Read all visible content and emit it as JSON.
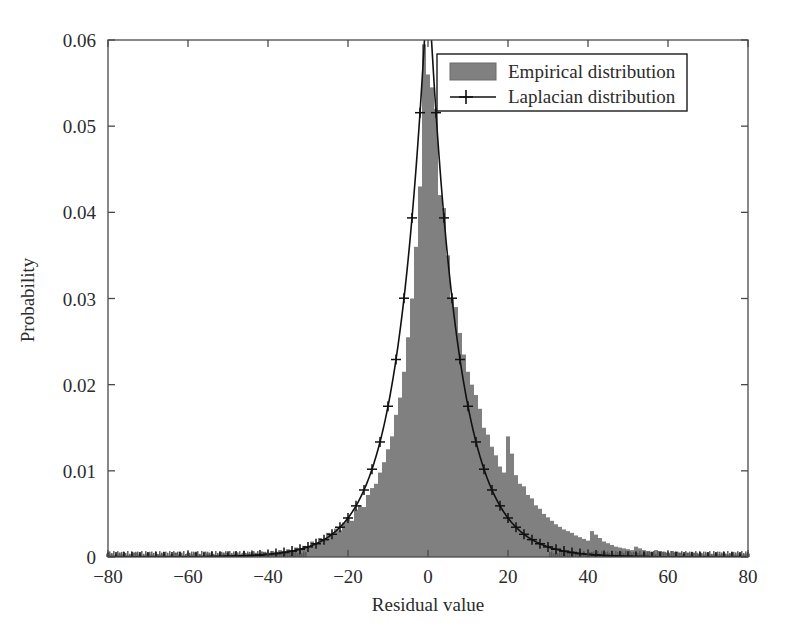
{
  "chart_data": {
    "type": "bar",
    "title": "",
    "xlabel": "Residual value",
    "ylabel": "Probability",
    "xlim": [
      -80,
      80
    ],
    "ylim": [
      0,
      0.06
    ],
    "xticks": [
      -80,
      -60,
      -40,
      -20,
      0,
      20,
      40,
      60,
      80
    ],
    "xticklabels": [
      "−80",
      "−60",
      "−40",
      "−20",
      "0",
      "20",
      "40",
      "60",
      "80"
    ],
    "yticks": [
      0,
      0.01,
      0.02,
      0.03,
      0.04,
      0.05,
      0.06
    ],
    "yticklabels": [
      "0",
      "0.01",
      "0.02",
      "0.03",
      "0.04",
      "0.05",
      "0.06"
    ],
    "grid": false,
    "legend_position": "top-right",
    "legend": [
      {
        "label": "Empirical distribution",
        "marker": "filled-rect",
        "color": "#808080"
      },
      {
        "label": "Laplacian distribution",
        "marker": "line-plus",
        "color": "#111111"
      }
    ],
    "series": [
      {
        "name": "Empirical distribution",
        "type": "bar",
        "color": "#808080",
        "bin_width": 1,
        "x": [
          -80,
          -79,
          -78,
          -77,
          -76,
          -75,
          -74,
          -73,
          -72,
          -71,
          -70,
          -69,
          -68,
          -67,
          -66,
          -65,
          -64,
          -63,
          -62,
          -61,
          -60,
          -59,
          -58,
          -57,
          -56,
          -55,
          -54,
          -53,
          -52,
          -51,
          -50,
          -49,
          -48,
          -47,
          -46,
          -45,
          -44,
          -43,
          -42,
          -41,
          -40,
          -39,
          -38,
          -37,
          -36,
          -35,
          -34,
          -33,
          -32,
          -31,
          -30,
          -29,
          -28,
          -27,
          -26,
          -25,
          -24,
          -23,
          -22,
          -21,
          -20,
          -19,
          -18,
          -17,
          -16,
          -15,
          -14,
          -13,
          -12,
          -11,
          -10,
          -9,
          -8,
          -7,
          -6,
          -5,
          -4,
          -3,
          -2,
          -1,
          0,
          1,
          2,
          3,
          4,
          5,
          6,
          7,
          8,
          9,
          10,
          11,
          12,
          13,
          14,
          15,
          16,
          17,
          18,
          19,
          20,
          21,
          22,
          23,
          24,
          25,
          26,
          27,
          28,
          29,
          30,
          31,
          32,
          33,
          34,
          35,
          36,
          37,
          38,
          39,
          40,
          41,
          42,
          43,
          44,
          45,
          46,
          47,
          48,
          49,
          50,
          51,
          52,
          53,
          54,
          55,
          56,
          57,
          58,
          59,
          60,
          61,
          62,
          63,
          64,
          65,
          66,
          67,
          68,
          69,
          70,
          71,
          72,
          73,
          74,
          75,
          76,
          77,
          78,
          79,
          80
        ],
        "values": [
          0.0004,
          0.0003,
          0.0002,
          0.0004,
          0.0003,
          0.0002,
          0.0003,
          0.0005,
          0.0003,
          0.0002,
          0.0004,
          0.0003,
          0.0002,
          0.0003,
          0.0004,
          0.0002,
          0.0003,
          0.0005,
          0.0003,
          0.0002,
          0.0004,
          0.0003,
          0.0005,
          0.0003,
          0.0002,
          0.0004,
          0.0003,
          0.0002,
          0.0003,
          0.0004,
          0.0005,
          0.0003,
          0.0004,
          0.0003,
          0.0005,
          0.0004,
          0.0003,
          0.0005,
          0.0004,
          0.0006,
          0.0005,
          0.0007,
          0.0006,
          0.0008,
          0.0007,
          0.0009,
          0.0008,
          0.0011,
          0.001,
          0.0013,
          0.0012,
          0.0018,
          0.0016,
          0.0022,
          0.002,
          0.0028,
          0.0026,
          0.0033,
          0.0031,
          0.004,
          0.0046,
          0.0042,
          0.0055,
          0.006,
          0.0058,
          0.0072,
          0.008,
          0.0085,
          0.0098,
          0.011,
          0.0125,
          0.014,
          0.0165,
          0.0185,
          0.0215,
          0.0255,
          0.03,
          0.036,
          0.043,
          0.0595,
          0.056,
          0.0545,
          0.052,
          0.042,
          0.0405,
          0.035,
          0.03,
          0.029,
          0.026,
          0.0235,
          0.0215,
          0.02,
          0.0188,
          0.0172,
          0.015,
          0.0142,
          0.0128,
          0.0118,
          0.0105,
          0.0098,
          0.014,
          0.012,
          0.0095,
          0.0085,
          0.0082,
          0.0072,
          0.0068,
          0.006,
          0.0056,
          0.005,
          0.0046,
          0.0042,
          0.0038,
          0.0035,
          0.0032,
          0.003,
          0.0028,
          0.0025,
          0.0023,
          0.0021,
          0.0019,
          0.003,
          0.0026,
          0.0022,
          0.0018,
          0.0016,
          0.0014,
          0.0012,
          0.0011,
          0.001,
          0.0009,
          0.0008,
          0.0012,
          0.001,
          0.0008,
          0.0007,
          0.0006,
          0.0008,
          0.0007,
          0.0006,
          0.0005,
          0.0007,
          0.0006,
          0.0005,
          0.0004,
          0.0005,
          0.0004,
          0.0005,
          0.0004,
          0.0003,
          0.0004,
          0.0003,
          0.0004,
          0.0003,
          0.0004,
          0.0003,
          0.0004,
          0.0003,
          0.0004,
          0.0003,
          0.0004
        ]
      },
      {
        "name": "Laplacian distribution",
        "type": "line",
        "color": "#111111",
        "marker": "plus",
        "marker_step": 2,
        "mu": 0,
        "b": 7.4,
        "peak_value": 0.0676,
        "note": "peak clipped above axis maximum 0.06"
      }
    ]
  },
  "axis": {
    "xlabel": "Residual value",
    "ylabel": "Probability"
  }
}
